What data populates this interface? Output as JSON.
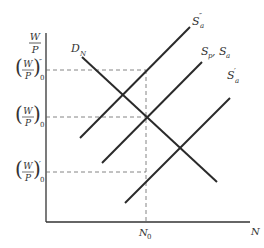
{
  "diagram": {
    "y_axis_label": {
      "num": "W",
      "den": "P"
    },
    "x_axis_label": "N",
    "x_tick_label": {
      "base": "N",
      "sub": "0"
    },
    "y_levels": [
      {
        "name": "high",
        "num": "W",
        "den": "P",
        "sup": "″",
        "sub": "0"
      },
      {
        "name": "equilibrium",
        "num": "W",
        "den": "P",
        "sup": "",
        "sub": "0"
      },
      {
        "name": "low",
        "num": "W",
        "den": "P",
        "sup": "′",
        "sub": "0"
      }
    ],
    "curves": [
      {
        "name": "demand",
        "label": "D",
        "sub": "N",
        "sup": ""
      },
      {
        "name": "supply-high",
        "label": "S",
        "sub": "a",
        "sup": "″"
      },
      {
        "name": "supply-mid",
        "label": "S",
        "sub": "p",
        "extra": ", S",
        "extra_sub": "a"
      },
      {
        "name": "supply-low",
        "label": "S",
        "sub": "a",
        "sup": "′"
      }
    ]
  }
}
